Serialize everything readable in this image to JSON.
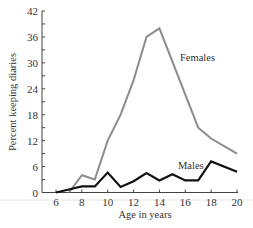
{
  "chart_data": {
    "type": "line",
    "title": "",
    "xlabel": "Age in years",
    "ylabel": "Percent keeping diaries",
    "xlim": [
      6,
      20
    ],
    "ylim": [
      0,
      42
    ],
    "x_ticks": [
      6,
      8,
      10,
      12,
      14,
      16,
      18,
      20
    ],
    "y_ticks": [
      0,
      6,
      12,
      18,
      24,
      30,
      36,
      42
    ],
    "y_minor_step": 3,
    "grid": false,
    "legend": "inline labels",
    "series": [
      {
        "name": "Females",
        "color": "#8c8c8c",
        "x": [
          7,
          8,
          9,
          10,
          11,
          12,
          13,
          14,
          17,
          18,
          20
        ],
        "values": [
          0,
          4,
          3,
          12,
          18,
          26,
          36,
          38,
          15,
          12.5,
          9
        ]
      },
      {
        "name": "Males",
        "color": "#111111",
        "x": [
          6,
          7,
          8,
          9,
          10,
          11,
          12,
          13,
          14,
          15,
          16,
          17,
          18,
          20
        ],
        "values": [
          0,
          0.7,
          1.4,
          1.4,
          4.6,
          1.3,
          2.6,
          4.5,
          2.8,
          4.2,
          2.8,
          2.8,
          7.2,
          4.8
        ]
      }
    ]
  },
  "labels": {
    "xlabel": "Age in years",
    "ylabel": "Percent keeping diaries",
    "females": "Females",
    "males": "Males"
  }
}
